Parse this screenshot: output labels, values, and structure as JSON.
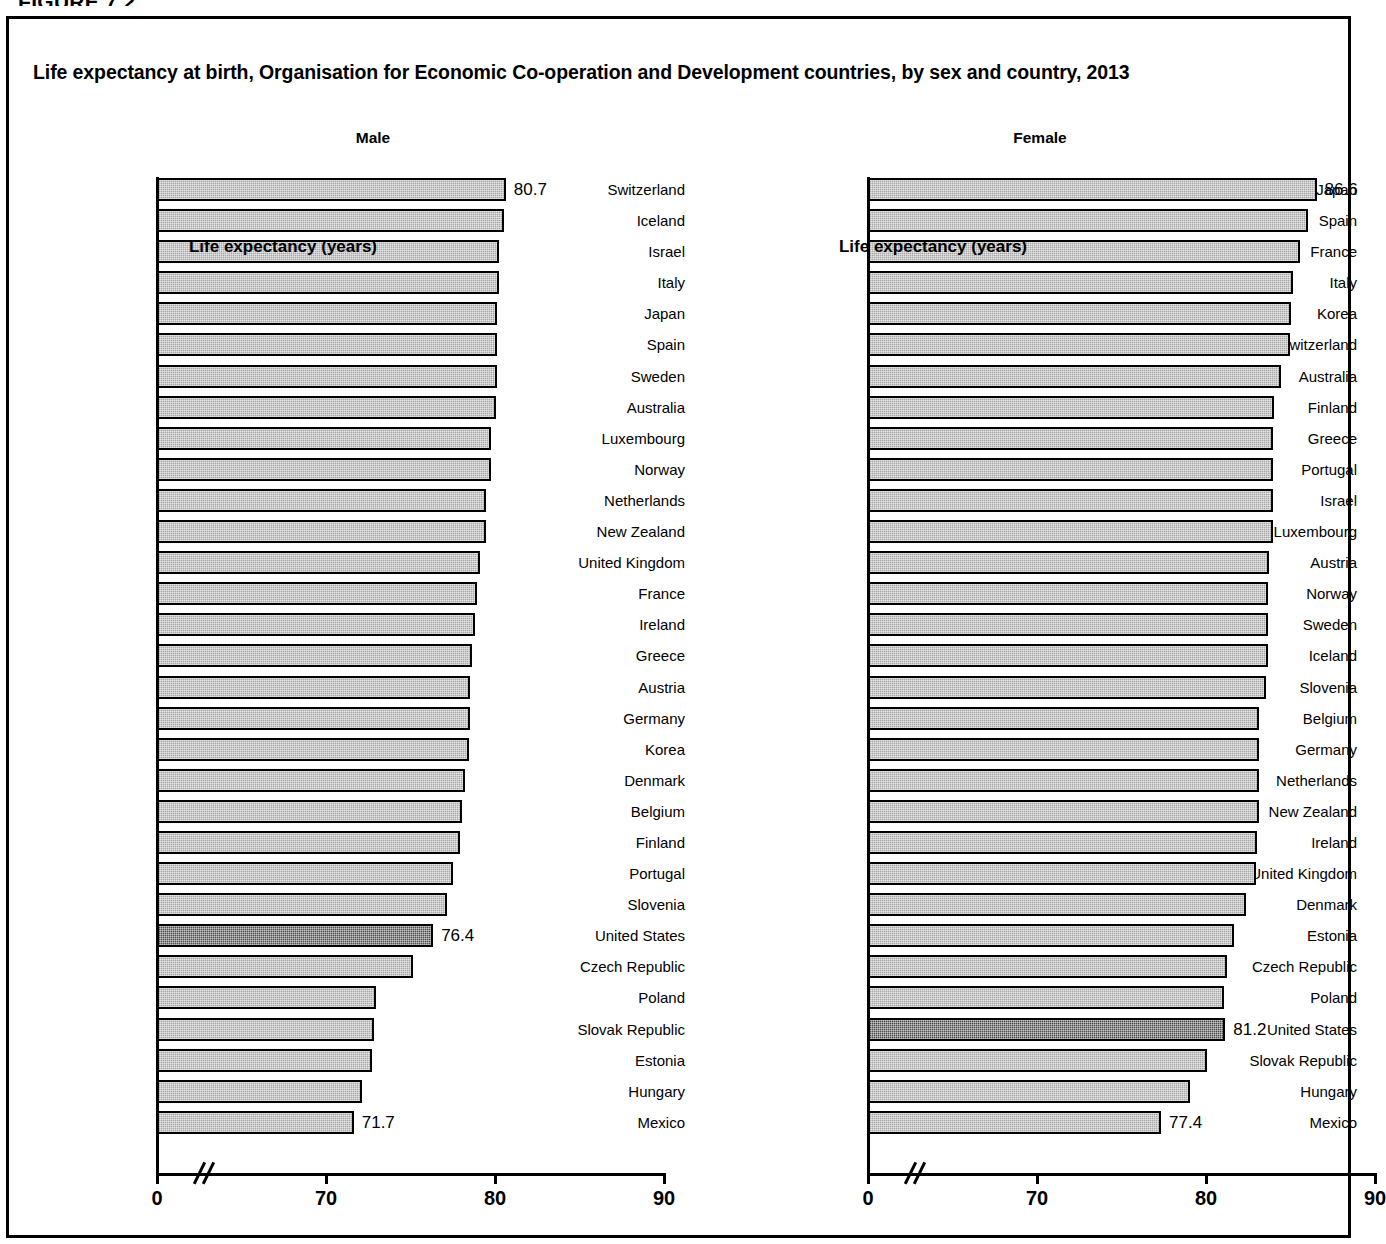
{
  "figure": {
    "tag": "FIGURE 7.2",
    "title": "Life expectancy at birth, Organisation for Economic Co-operation and Development countries, by sex and country, 2013"
  },
  "axis": {
    "title": "Life expectancy (years)",
    "tick_labels": [
      "0",
      "70",
      "80",
      "90"
    ],
    "break_marker": "//"
  },
  "colors": {
    "bar_fill": "#a8a8a8",
    "bar_highlight_fill": "#4a4a4a",
    "bar_border": "#000000",
    "frame": "#000000",
    "background": "#ffffff"
  },
  "chart_data": {
    "type": "bar",
    "title": "Life expectancy at birth, Organisation for Economic Co-operation and Development countries, by sex and country, 2013",
    "xlabel": "Life expectancy (years)",
    "ylabel": "",
    "orientation": "horizontal",
    "xlim": [
      0,
      90
    ],
    "x_axis_break": {
      "from": 0,
      "to": 70
    },
    "xticks": [
      0,
      70,
      80,
      90
    ],
    "grid": false,
    "legend": "none",
    "highlight_category": "United States",
    "panels": [
      {
        "name": "male",
        "label": "Male",
        "categories": [
          "Switzerland",
          "Iceland",
          "Israel",
          "Italy",
          "Japan",
          "Spain",
          "Sweden",
          "Australia",
          "Luxembourg",
          "Norway",
          "Netherlands",
          "New Zealand",
          "United Kingdom",
          "France",
          "Ireland",
          "Greece",
          "Austria",
          "Germany",
          "Korea",
          "Denmark",
          "Belgium",
          "Finland",
          "Portugal",
          "Slovenia",
          "United States",
          "Czech Republic",
          "Poland",
          "Slovak Republic",
          "Estonia",
          "Hungary",
          "Mexico"
        ],
        "values": [
          80.7,
          80.6,
          80.3,
          80.3,
          80.2,
          80.2,
          80.2,
          80.1,
          79.8,
          79.8,
          79.5,
          79.5,
          79.2,
          79.0,
          78.9,
          78.7,
          78.6,
          78.6,
          78.5,
          78.3,
          78.1,
          78.0,
          77.6,
          77.2,
          76.4,
          75.2,
          73.0,
          72.9,
          72.8,
          72.2,
          71.7
        ],
        "labeled_points": [
          {
            "category": "Switzerland",
            "value": 80.7,
            "text": "80.7"
          },
          {
            "category": "United States",
            "value": 76.4,
            "text": "76.4"
          },
          {
            "category": "Mexico",
            "value": 71.7,
            "text": "71.7"
          }
        ]
      },
      {
        "name": "female",
        "label": "Female",
        "categories": [
          "Japan",
          "Spain",
          "France",
          "Italy",
          "Korea",
          "Switzerland",
          "Australia",
          "Finland",
          "Greece",
          "Portugal",
          "Israel",
          "Luxembourg",
          "Austria",
          "Norway",
          "Sweden",
          "Iceland",
          "Slovenia",
          "Belgium",
          "Germany",
          "Netherlands",
          "New Zealand",
          "Ireland",
          "United Kingdom",
          "Denmark",
          "Estonia",
          "Czech Republic",
          "Poland",
          "United States",
          "Slovak Republic",
          "Hungary",
          "Mexico"
        ],
        "values": [
          86.6,
          86.1,
          85.6,
          85.2,
          85.1,
          85.0,
          84.5,
          84.1,
          84.0,
          84.0,
          84.0,
          84.0,
          83.8,
          83.7,
          83.7,
          83.7,
          83.6,
          83.2,
          83.2,
          83.2,
          83.2,
          83.1,
          83.0,
          82.4,
          81.7,
          81.3,
          81.1,
          81.2,
          80.1,
          79.1,
          77.4
        ],
        "labeled_points": [
          {
            "category": "Japan",
            "value": 86.6,
            "text": "86.6"
          },
          {
            "category": "United States",
            "value": 81.2,
            "text": "81.2"
          },
          {
            "category": "Mexico",
            "value": 77.4,
            "text": "77.4"
          }
        ]
      }
    ]
  }
}
